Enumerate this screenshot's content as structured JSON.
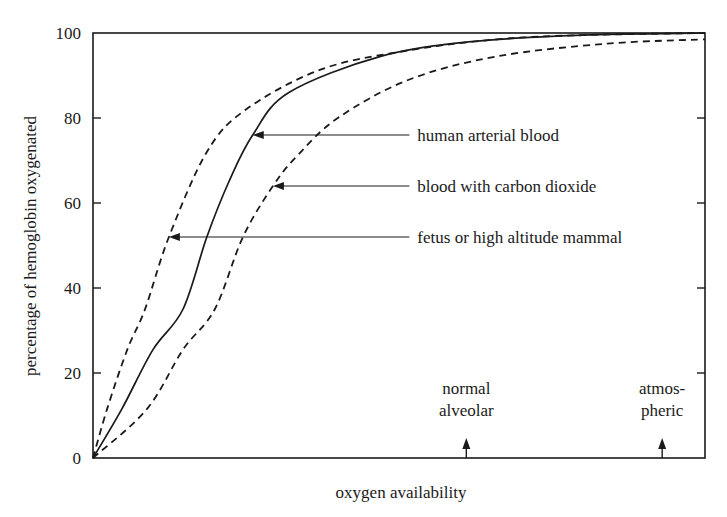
{
  "chart_data": {
    "type": "line",
    "title": "",
    "xlabel": "oxygen availability",
    "ylabel": "percentage of hemoglobin oxygenated",
    "ylim": [
      0,
      100
    ],
    "yticks": [
      0,
      20,
      40,
      60,
      80,
      100
    ],
    "ytick_labels": [
      "0",
      "20",
      "40",
      "60",
      "80",
      "100"
    ],
    "xlim": [
      0,
      100
    ],
    "xticks": [],
    "grid": false,
    "legend": "annotations with arrows",
    "x_markers": [
      {
        "label_lines": [
          "normal",
          "alveolar"
        ],
        "x": 61
      },
      {
        "label_lines": [
          "atmos-",
          "pheric"
        ],
        "x": 93
      }
    ],
    "series": [
      {
        "name": "fetus or high altitude mammal",
        "style": "dashed",
        "x": [
          0,
          2.3,
          5.6,
          8.5,
          12.4,
          18.6,
          25.0,
          37.4,
          52,
          66,
          80,
          100
        ],
        "values": [
          0,
          11.5,
          25.5,
          35,
          52,
          72,
          82,
          91.5,
          96,
          98.5,
          99.5,
          100
        ],
        "annotation": {
          "arrow_at": [
            12.4,
            52
          ],
          "label_x": 53
        }
      },
      {
        "name": "human arterial blood",
        "style": "solid",
        "x": [
          0,
          4.7,
          9.8,
          14.7,
          18.6,
          22.2,
          26.1,
          32,
          47,
          62,
          80,
          100
        ],
        "values": [
          0,
          11.5,
          25.5,
          35,
          52,
          65,
          76,
          86,
          94.5,
          98,
          99.5,
          100
        ],
        "annotation": {
          "arrow_at": [
            26.1,
            76
          ],
          "label_x": 53
        }
      },
      {
        "name": "blood with carbon dioxide",
        "style": "dashed",
        "x": [
          0,
          8.8,
          14.7,
          19.9,
          24.5,
          29.4,
          33.3,
          40,
          51.6,
          66,
          84,
          100
        ],
        "values": [
          0,
          11.5,
          25.5,
          35,
          52,
          64,
          71,
          80,
          89,
          94.5,
          97.5,
          98.5
        ],
        "annotation": {
          "arrow_at": [
            29.4,
            64
          ],
          "label_x": 53
        }
      }
    ]
  }
}
